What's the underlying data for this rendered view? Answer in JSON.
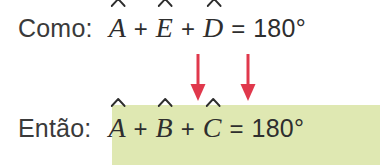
{
  "figure": {
    "background_color": "#ffffff",
    "text_color": "#2e2e2e",
    "label_color": "#3a3a3a",
    "highlight_color": "#dfe8b2",
    "arrow_color": "#e0384c"
  },
  "premise": {
    "label": "Como:",
    "equation": {
      "terms": [
        "A",
        "E",
        "D"
      ],
      "accent": "hat",
      "operator": "+",
      "equals": "=",
      "value": "180°",
      "text": "Â + Ê + D̂ = 180°"
    }
  },
  "conclusion": {
    "label": "Então:",
    "highlighted": true,
    "equation": {
      "terms": [
        "A",
        "B",
        "C"
      ],
      "accent": "hat",
      "operator": "+",
      "equals": "=",
      "value": "180°",
      "text": "Â + B̂ + Ĉ = 180°"
    }
  },
  "arrows": [
    {
      "name": "arrow-from-E",
      "direction": "down",
      "color": "#e0384c"
    },
    {
      "name": "arrow-from-D",
      "direction": "down",
      "color": "#e0384c"
    }
  ]
}
